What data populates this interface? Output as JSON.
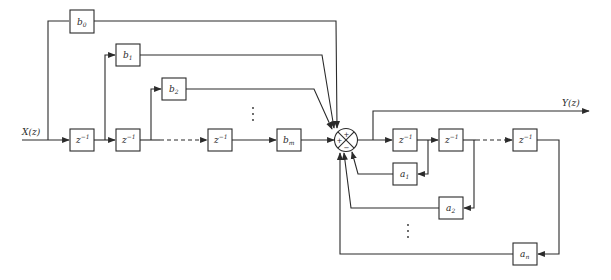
{
  "diagram": {
    "type": "IIR filter direct-form block diagram",
    "input_label": "X(z)",
    "output_label": "Y(z)",
    "feedforward": {
      "delays": [
        {
          "id": "ff-delay-1",
          "label": "z",
          "sup": "−1"
        },
        {
          "id": "ff-delay-2",
          "label": "z",
          "sup": "−1"
        },
        {
          "id": "ff-delay-m",
          "label": "z",
          "sup": "−1"
        }
      ],
      "coefficients": [
        {
          "id": "b0",
          "label": "b",
          "sub": "0"
        },
        {
          "id": "b1",
          "label": "b",
          "sub": "1"
        },
        {
          "id": "b2",
          "label": "b",
          "sub": "2"
        },
        {
          "id": "bm",
          "label": "b",
          "sub": "m"
        }
      ]
    },
    "summer": {
      "signs": {
        "top": "+",
        "left": "+",
        "bottom": "−"
      }
    },
    "feedback": {
      "delays": [
        {
          "id": "fb-delay-1",
          "label": "z",
          "sup": "−1"
        },
        {
          "id": "fb-delay-2",
          "label": "z",
          "sup": "−1"
        },
        {
          "id": "fb-delay-n",
          "label": "z",
          "sup": "−1"
        }
      ],
      "coefficients": [
        {
          "id": "a1",
          "label": "a",
          "sub": "1"
        },
        {
          "id": "a2",
          "label": "a",
          "sub": "2"
        },
        {
          "id": "an",
          "label": "a",
          "sub": "n"
        }
      ]
    },
    "ellipsis": "⋮"
  }
}
